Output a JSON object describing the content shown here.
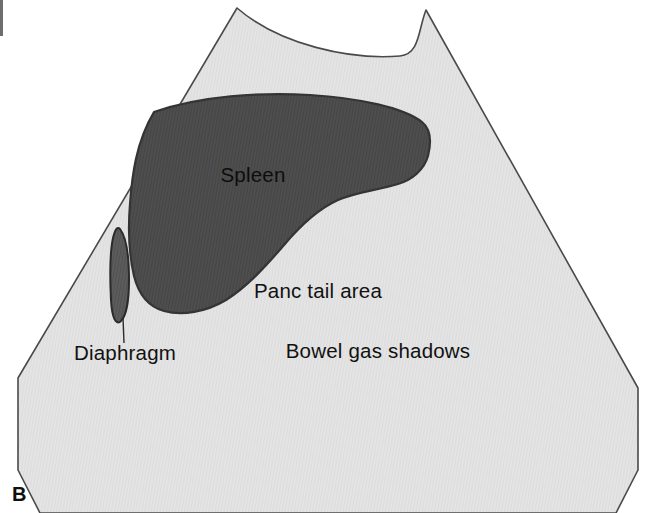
{
  "figure": {
    "panel_letter": "B",
    "type": "ultrasound-scan-line-drawing",
    "modality": "Ultrasound sector scan schematic",
    "region": "Left upper quadrant / splenic view"
  },
  "colors": {
    "page_background": "#ffffff",
    "scan_sector_fill": "#e3e3e3",
    "scan_sector_stroke": "#4a4a4a",
    "spleen_fill": "#4d4d4d",
    "spleen_stroke": "#343434",
    "diaphragm_fill": "#5a5a5a",
    "diaphragm_stroke": "#2b2b2b",
    "label_text": "#111111",
    "leader_line": "#2b2b2b",
    "corner_tick": "#6d6d6d"
  },
  "annotations": [
    {
      "id": "spleen",
      "label": "Spleen",
      "x": 253,
      "y": 182,
      "anchor": "middle",
      "on_dark": true,
      "leader": false
    },
    {
      "id": "panc-tail-area",
      "label": "Panc tail area",
      "x": 318,
      "y": 298,
      "anchor": "middle",
      "on_dark": false,
      "leader": false
    },
    {
      "id": "bowel-gas-shadows",
      "label": "Bowel gas shadows",
      "x": 378,
      "y": 358,
      "anchor": "middle",
      "on_dark": false,
      "leader": false
    },
    {
      "id": "diaphragm",
      "label": "Diaphragm",
      "x": 125,
      "y": 360,
      "anchor": "middle",
      "on_dark": false,
      "leader": true,
      "leader_x1": 124,
      "leader_y1": 343,
      "leader_x2": 123,
      "leader_y2": 318
    }
  ],
  "shapes": {
    "scan_sector": {
      "name": "ultrasound-sector-field",
      "description": "Trapezoidal sector scan field with concave curved top and clipped bottom corners",
      "path": "M 237 8 C 280 45 350 60 400 56 C 420 54 418 30 426 10 L 638 388 L 638 470 L 616 513 L 40 513 L 18 470 L 18 378 Z"
    },
    "spleen": {
      "name": "spleen-organ-outline",
      "description": "Large dark crescent organ occupying upper left of the sector",
      "path": "M 154 112 C 200 96 260 92 310 95 C 360 98 404 108 422 122 C 432 130 431 144 428 156 C 424 170 412 180 398 184 C 378 190 356 192 338 200 C 318 209 300 226 284 245 C 266 266 248 286 226 300 C 206 312 182 316 164 311 C 146 306 138 292 134 276 C 129 254 128 228 130 204 C 132 176 136 142 154 112 Z"
    },
    "diaphragm": {
      "name": "diaphragm-band",
      "description": "Narrow elongated vertical lens shape along the left sector margin",
      "path": "M 120 229 C 127 238 129 258 129 280 C 129 300 126 316 121 321 C 116 326 112 318 111 300 C 110 280 110 252 113 238 C 115 230 117 226 120 229 Z"
    }
  }
}
